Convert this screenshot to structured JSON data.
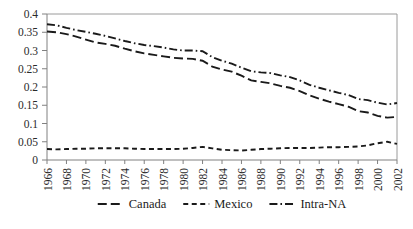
{
  "chart_data": {
    "type": "line",
    "title": "",
    "subtitle": "",
    "xlabel": "",
    "ylabel": "",
    "grid": false,
    "legend_position": "bottom",
    "ylim": [
      0,
      0.4
    ],
    "yticks": [
      "0",
      "0.05",
      "0.1",
      "0.15",
      "0.2",
      "0.25",
      "0.3",
      "0.35",
      "0.4"
    ],
    "ytick_values": [
      0,
      0.05,
      0.1,
      0.15,
      0.2,
      0.25,
      0.3,
      0.35,
      0.4
    ],
    "xlim": [
      1966,
      2002
    ],
    "categories": [
      1966,
      1967,
      1968,
      1969,
      1970,
      1971,
      1972,
      1973,
      1974,
      1975,
      1976,
      1977,
      1978,
      1979,
      1980,
      1981,
      1982,
      1983,
      1984,
      1985,
      1986,
      1987,
      1988,
      1989,
      1990,
      1991,
      1992,
      1993,
      1994,
      1995,
      1996,
      1997,
      1998,
      1999,
      2000,
      2001,
      2002
    ],
    "xticks": [
      "1966",
      "1968",
      "1970",
      "1972",
      "1974",
      "1976",
      "1978",
      "1980",
      "1982",
      "1984",
      "1986",
      "1988",
      "1990",
      "1992",
      "1994",
      "1996",
      "1998",
      "2000",
      "2002"
    ],
    "series": [
      {
        "name": "Canada",
        "dash_style": "long-dash",
        "values": [
          0.352,
          0.35,
          0.345,
          0.338,
          0.33,
          0.322,
          0.318,
          0.313,
          0.305,
          0.298,
          0.292,
          0.288,
          0.284,
          0.28,
          0.278,
          0.277,
          0.272,
          0.256,
          0.248,
          0.242,
          0.231,
          0.218,
          0.214,
          0.21,
          0.203,
          0.198,
          0.189,
          0.177,
          0.168,
          0.16,
          0.153,
          0.146,
          0.134,
          0.13,
          0.121,
          0.116,
          0.118
        ]
      },
      {
        "name": "Mexico",
        "dash_style": "short-dash",
        "values": [
          0.03,
          0.029,
          0.03,
          0.031,
          0.031,
          0.032,
          0.032,
          0.032,
          0.032,
          0.031,
          0.03,
          0.03,
          0.03,
          0.03,
          0.031,
          0.033,
          0.036,
          0.032,
          0.028,
          0.027,
          0.026,
          0.028,
          0.03,
          0.031,
          0.032,
          0.033,
          0.033,
          0.033,
          0.034,
          0.035,
          0.035,
          0.036,
          0.037,
          0.04,
          0.046,
          0.05,
          0.044
        ]
      },
      {
        "name": "Intra-NA",
        "dash_style": "dash-dot",
        "values": [
          0.372,
          0.369,
          0.362,
          0.356,
          0.351,
          0.346,
          0.34,
          0.333,
          0.326,
          0.32,
          0.315,
          0.312,
          0.308,
          0.303,
          0.3,
          0.3,
          0.298,
          0.282,
          0.272,
          0.264,
          0.253,
          0.243,
          0.24,
          0.238,
          0.232,
          0.227,
          0.218,
          0.206,
          0.198,
          0.191,
          0.184,
          0.178,
          0.167,
          0.164,
          0.157,
          0.152,
          0.156
        ]
      }
    ],
    "legend": [
      {
        "label": "Canada",
        "dash_style": "long-dash"
      },
      {
        "label": "Mexico",
        "dash_style": "short-dash"
      },
      {
        "label": "Intra-NA",
        "dash_style": "dash-dot"
      }
    ],
    "colors": {
      "series_line": "#1a1a1a",
      "axis": "#808080",
      "text": "#1a1a1a",
      "background": "#ffffff"
    }
  }
}
